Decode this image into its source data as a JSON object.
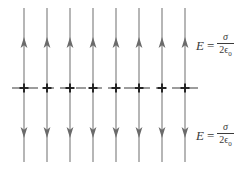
{
  "figure": {
    "colors": {
      "field_line": "#7a7a7a",
      "arrow": "#6b6b6b",
      "plane_line": "#3a3a3a",
      "charge": "#222222",
      "text": "#3a3a3a",
      "background": "#ffffff"
    },
    "field_lines": {
      "count": 8,
      "x_positions": [
        24,
        47,
        70,
        93,
        116,
        139,
        162,
        185
      ],
      "top_y_start": 8,
      "top_y_end": 86,
      "bottom_y_start": 90,
      "bottom_y_end": 162,
      "upper_arrow_tip_y": 38,
      "lower_arrow_tip_y": 138,
      "upper_direction": "up",
      "lower_direction": "down"
    },
    "plane": {
      "y": 88,
      "x_start": 12,
      "x_end": 200,
      "style": "dashed",
      "charge_symbol": "+",
      "charge_count": 8,
      "charge_x_positions": [
        24,
        47,
        70,
        93,
        116,
        139,
        162,
        185
      ]
    },
    "labels": [
      {
        "id": "label-top",
        "quantity": "E",
        "equals": "=",
        "numerator": "σ",
        "denominator_coefficient": "2",
        "denominator_symbol": "ϵ",
        "denominator_subscript": "0",
        "full_text": "E = σ / 2ϵ₀"
      },
      {
        "id": "label-bottom",
        "quantity": "E",
        "equals": "=",
        "numerator": "σ",
        "denominator_coefficient": "2",
        "denominator_symbol": "ϵ",
        "denominator_subscript": "0",
        "full_text": "E = σ / 2ϵ₀"
      }
    ]
  }
}
